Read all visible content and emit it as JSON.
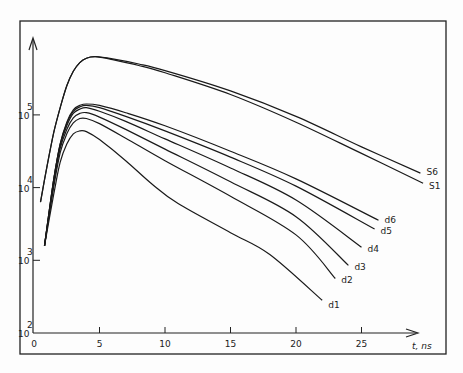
{
  "chart_data": {
    "type": "line",
    "title": "",
    "xlabel": "t, ns",
    "ylabel": "",
    "yscale": "log",
    "xlim": [
      0,
      31
    ],
    "ylim_log10": [
      2,
      6.3
    ],
    "grid": false,
    "x_ticks": [
      "0",
      "5",
      "10",
      "15",
      "20",
      "25"
    ],
    "x_tick_values": [
      0,
      5,
      10,
      15,
      20,
      25
    ],
    "y_ticks": [
      {
        "base": "10",
        "exp": "2",
        "value": 100
      },
      {
        "base": "10",
        "exp": "3",
        "value": 1000
      },
      {
        "base": "10",
        "exp": "4",
        "value": 10000
      },
      {
        "base": "10",
        "exp": "5",
        "value": 100000
      }
    ],
    "series": [
      {
        "name": "S6",
        "points": [
          [
            0.5,
            3.8
          ],
          [
            1,
            4.3
          ],
          [
            1.5,
            4.75
          ],
          [
            2,
            5.1
          ],
          [
            2.5,
            5.4
          ],
          [
            3,
            5.6
          ],
          [
            3.5,
            5.72
          ],
          [
            4,
            5.78
          ],
          [
            4.7,
            5.8
          ],
          [
            6,
            5.77
          ],
          [
            8,
            5.7
          ],
          [
            10,
            5.61
          ],
          [
            15,
            5.33
          ],
          [
            20,
            4.98
          ],
          [
            25,
            4.56
          ],
          [
            29.5,
            4.2
          ]
        ]
      },
      {
        "name": "S1",
        "points": [
          [
            0.5,
            3.8
          ],
          [
            1,
            4.3
          ],
          [
            1.5,
            4.75
          ],
          [
            2,
            5.1
          ],
          [
            2.5,
            5.4
          ],
          [
            3,
            5.6
          ],
          [
            3.5,
            5.72
          ],
          [
            4,
            5.78
          ],
          [
            4.7,
            5.8
          ],
          [
            6,
            5.76
          ],
          [
            8,
            5.68
          ],
          [
            10,
            5.58
          ],
          [
            15,
            5.28
          ],
          [
            20,
            4.9
          ],
          [
            25,
            4.47
          ],
          [
            29.7,
            4.06
          ]
        ]
      },
      {
        "name": "d6",
        "points": [
          [
            0.8,
            3.2
          ],
          [
            1.5,
            4.1
          ],
          [
            2,
            4.6
          ],
          [
            2.5,
            4.9
          ],
          [
            3,
            5.07
          ],
          [
            3.5,
            5.13
          ],
          [
            4,
            5.15
          ],
          [
            5,
            5.13
          ],
          [
            7,
            5.03
          ],
          [
            10,
            4.85
          ],
          [
            15,
            4.5
          ],
          [
            20,
            4.12
          ],
          [
            26.3,
            3.55
          ]
        ]
      },
      {
        "name": "d5",
        "points": [
          [
            0.8,
            3.2
          ],
          [
            1.5,
            4.1
          ],
          [
            2,
            4.6
          ],
          [
            2.5,
            4.88
          ],
          [
            3,
            5.05
          ],
          [
            3.5,
            5.11
          ],
          [
            4,
            5.13
          ],
          [
            5,
            5.1
          ],
          [
            7,
            4.98
          ],
          [
            10,
            4.78
          ],
          [
            15,
            4.42
          ],
          [
            20,
            4.02
          ],
          [
            26,
            3.43
          ]
        ]
      },
      {
        "name": "d4",
        "points": [
          [
            0.8,
            3.2
          ],
          [
            1.5,
            4.1
          ],
          [
            2,
            4.58
          ],
          [
            2.5,
            4.85
          ],
          [
            3,
            5.02
          ],
          [
            3.5,
            5.08
          ],
          [
            4,
            5.1
          ],
          [
            5,
            5.05
          ],
          [
            7,
            4.91
          ],
          [
            10,
            4.67
          ],
          [
            15,
            4.27
          ],
          [
            20,
            3.83
          ],
          [
            25,
            3.18
          ]
        ]
      },
      {
        "name": "d3",
        "points": [
          [
            0.8,
            3.2
          ],
          [
            1.5,
            4.05
          ],
          [
            2,
            4.54
          ],
          [
            2.5,
            4.8
          ],
          [
            3,
            4.96
          ],
          [
            3.5,
            5.02
          ],
          [
            4,
            5.03
          ],
          [
            5,
            4.97
          ],
          [
            7,
            4.8
          ],
          [
            10,
            4.53
          ],
          [
            15,
            4.08
          ],
          [
            20,
            3.6
          ],
          [
            24,
            2.93
          ]
        ]
      },
      {
        "name": "d2",
        "points": [
          [
            0.8,
            3.2
          ],
          [
            1.5,
            4.0
          ],
          [
            2,
            4.48
          ],
          [
            2.5,
            4.74
          ],
          [
            3,
            4.89
          ],
          [
            3.5,
            4.95
          ],
          [
            4,
            4.95
          ],
          [
            5,
            4.88
          ],
          [
            7,
            4.68
          ],
          [
            10,
            4.37
          ],
          [
            15,
            3.88
          ],
          [
            20,
            3.35
          ],
          [
            23,
            2.75
          ]
        ]
      },
      {
        "name": "d1",
        "points": [
          [
            0.8,
            3.2
          ],
          [
            1.5,
            3.9
          ],
          [
            2,
            4.35
          ],
          [
            2.5,
            4.6
          ],
          [
            3,
            4.74
          ],
          [
            3.5,
            4.78
          ],
          [
            4,
            4.77
          ],
          [
            5,
            4.66
          ],
          [
            7,
            4.37
          ],
          [
            9,
            4.05
          ],
          [
            11,
            3.78
          ],
          [
            15,
            3.38
          ],
          [
            18,
            3.08
          ],
          [
            22,
            2.45
          ]
        ]
      }
    ],
    "series_labels": [
      "S6",
      "S1",
      "d6",
      "d5",
      "d4",
      "d3",
      "d2",
      "d1"
    ],
    "note": "y points given as log10(value)"
  }
}
